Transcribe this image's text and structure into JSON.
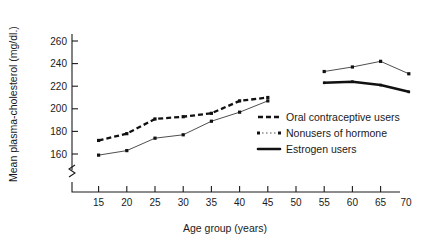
{
  "chart_data": {
    "type": "line",
    "title": "",
    "xlabel": "Age group (years)",
    "ylabel": "Mean plasma-cholesterol (mg/dl.)",
    "xlim": [
      10,
      75
    ],
    "ylim": [
      155,
      265
    ],
    "xticks": [
      15,
      20,
      25,
      30,
      35,
      40,
      45,
      50,
      55,
      60,
      65,
      70
    ],
    "yticks": [
      160,
      180,
      200,
      220,
      240,
      260
    ],
    "xtick_labels": [
      "15",
      "20",
      "25",
      "30",
      "35",
      "40",
      "45",
      "50",
      "55",
      "60",
      "65",
      "70"
    ],
    "ytick_labels": [
      "160",
      "180",
      "200",
      "220",
      "240",
      "260"
    ],
    "grid": false,
    "y_axis_break": true,
    "legend_position": "center-right",
    "series": [
      {
        "name": "Oral contraceptive users",
        "style": "thick-dashed",
        "x": [
          15,
          20,
          25,
          30,
          35,
          40,
          45
        ],
        "values": [
          172,
          178,
          191,
          193,
          196,
          207,
          210
        ]
      },
      {
        "name": "Nonusers of hormone",
        "style": "thin-solid-dotted",
        "x": [
          15,
          20,
          25,
          30,
          35,
          40,
          45,
          55,
          60,
          65,
          70
        ],
        "values": [
          159,
          163,
          174,
          177,
          189,
          197,
          207,
          233,
          237,
          242,
          231
        ]
      },
      {
        "name": "Estrogen users",
        "style": "thick-solid",
        "x": [
          55,
          60,
          65,
          70
        ],
        "values": [
          223,
          224,
          221,
          215
        ]
      }
    ]
  },
  "legend": {
    "items": [
      {
        "label": "Oral contraceptive users",
        "marker": "thick-dashed-line-icon"
      },
      {
        "label": "Nonusers of hormone",
        "marker": "thin-dotted-line-icon"
      },
      {
        "label": "Estrogen users",
        "marker": "thick-solid-line-icon"
      }
    ]
  },
  "colors": {
    "ink": "#111111",
    "background": "#ffffff",
    "thin_line": "#3a3a3a"
  }
}
